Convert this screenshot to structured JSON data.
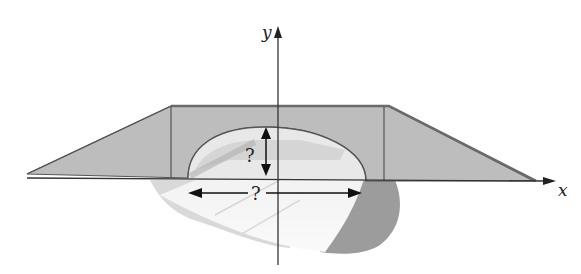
{
  "figure": {
    "axes": {
      "x_label": "x",
      "y_label": "y"
    },
    "annotations": {
      "height_label": "?",
      "width_label": "?"
    },
    "colors": {
      "bridge_fill": "#b9b9b9",
      "bridge_edge": "#5a5a5a",
      "road_light": "#ececec",
      "terrain_shadow": "#9a9a9a",
      "axis": "#333333"
    }
  }
}
